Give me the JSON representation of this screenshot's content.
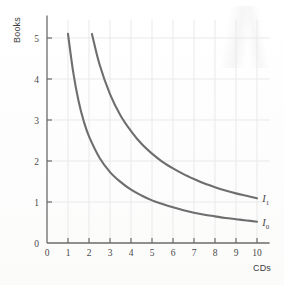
{
  "figure": {
    "background_color": "#fefefe",
    "curve_color": "#6e6e6e",
    "axis_color": "#6b6b6b",
    "grid_color": "#e9e9e9",
    "text_color": "#4a4a4a"
  },
  "chart_data": {
    "type": "line",
    "title": "",
    "subtitle": "",
    "xlabel": "CDs",
    "ylabel": "Books",
    "xlim": [
      0,
      10.6
    ],
    "ylim": [
      0,
      5.45
    ],
    "xticks": [
      0,
      1,
      2,
      3,
      4,
      5,
      6,
      7,
      8,
      9,
      10
    ],
    "xticklabels": [
      "0",
      "1",
      "2",
      "3",
      "4",
      "5",
      "6",
      "7",
      "8",
      "9",
      "10"
    ],
    "yticks": [
      0,
      1,
      2,
      3,
      4,
      5
    ],
    "yticklabels": [
      "0",
      "1",
      "2",
      "3",
      "4",
      "5"
    ],
    "grid": true,
    "grid_style": "solid-light",
    "legend": "inline-end-labels",
    "legend_position": "right-of-curve-ends",
    "series": [
      {
        "name": "I0",
        "label": "I",
        "label_subscript": "0",
        "description": "lower indifference curve",
        "form": "y = 5.2 / x",
        "constant": 5.2,
        "x": [
          1.0,
          1.25,
          1.5,
          1.75,
          2.0,
          2.5,
          3.0,
          3.5,
          4.0,
          4.5,
          5.0,
          5.5,
          6.0,
          6.5,
          7.0,
          7.5,
          8.0,
          8.5,
          9.0,
          9.5,
          10.0
        ],
        "values": [
          5.1,
          4.16,
          3.47,
          2.97,
          2.6,
          2.08,
          1.73,
          1.49,
          1.3,
          1.16,
          1.04,
          0.95,
          0.87,
          0.8,
          0.74,
          0.69,
          0.65,
          0.61,
          0.58,
          0.55,
          0.52
        ],
        "label_x": 10.25,
        "label_y": 0.52
      },
      {
        "name": "I1",
        "label": "I",
        "label_subscript": "1",
        "description": "upper indifference curve",
        "form": "y = 10.9 / x",
        "constant": 10.9,
        "x": [
          2.14,
          2.5,
          3.0,
          3.5,
          4.0,
          4.5,
          5.0,
          5.5,
          6.0,
          6.5,
          7.0,
          7.5,
          8.0,
          8.5,
          9.0,
          9.5,
          10.0
        ],
        "values": [
          5.1,
          4.36,
          3.63,
          3.11,
          2.73,
          2.42,
          2.18,
          1.98,
          1.82,
          1.68,
          1.56,
          1.45,
          1.36,
          1.28,
          1.21,
          1.15,
          1.09
        ],
        "label_x": 10.25,
        "label_y": 1.09
      }
    ]
  }
}
